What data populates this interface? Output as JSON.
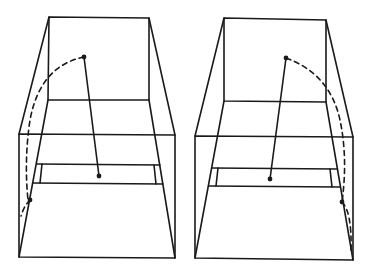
{
  "diagram": {
    "type": "perspective-line-drawing",
    "background": "#ffffff",
    "stroke_color": "#1a1a1a",
    "panels": [
      {
        "id": "left",
        "box": {
          "back_face": [
            [
              49,
              17
            ],
            [
              149,
              18
            ],
            [
              149,
              100
            ],
            [
              48,
              100
            ]
          ],
          "front_face": [
            [
              19,
              134
            ],
            [
              175,
              135
            ],
            [
              175,
              258
            ],
            [
              19,
              257
            ]
          ],
          "strip": {
            "top_y": 164,
            "bottom_y": 183,
            "x_left": 35,
            "x_right": 162
          }
        },
        "solid_segment": {
          "from": [
            84,
            57
          ],
          "to": [
            99,
            176
          ]
        },
        "dashed_arc": {
          "from": [
            84,
            57
          ],
          "through": [
            30,
            110
          ],
          "to": [
            30,
            200
          ]
        },
        "arc_end_dot": [
          30,
          200
        ]
      },
      {
        "id": "right",
        "box": {
          "back_face": [
            [
              224,
              18
            ],
            [
              326,
              20
            ],
            [
              326,
              102
            ],
            [
              224,
              101
            ]
          ],
          "front_face": [
            [
              195,
              136
            ],
            [
              353,
              137
            ],
            [
              353,
              260
            ],
            [
              195,
              258
            ]
          ],
          "strip": {
            "top_y": 168,
            "bottom_y": 186,
            "x_left": 210,
            "x_right": 338
          }
        },
        "solid_segment": {
          "from": [
            286,
            58
          ],
          "to": [
            270,
            179
          ]
        },
        "dashed_arc": {
          "from": [
            286,
            58
          ],
          "through": [
            340,
            110
          ],
          "to": [
            342,
            202
          ]
        },
        "arc_end_dot": [
          342,
          202
        ]
      }
    ]
  }
}
